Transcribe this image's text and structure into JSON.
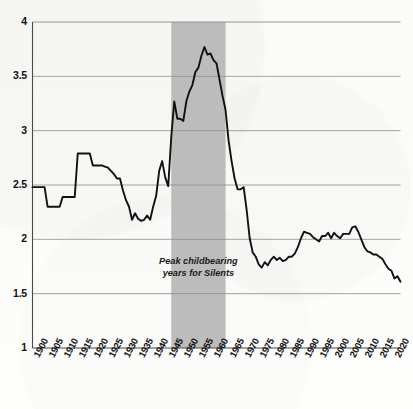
{
  "chart_data": {
    "type": "line",
    "title": "",
    "subtitle": "",
    "xlabel": "",
    "ylabel": "",
    "xlim": [
      1900,
      2022
    ],
    "ylim": [
      1,
      4
    ],
    "grid": true,
    "legend": "none",
    "y_ticks": [
      "4",
      "3.5",
      "3",
      "2.5",
      "2",
      "1.5",
      "1"
    ],
    "y_tick_values": [
      4,
      3.5,
      3,
      2.5,
      2,
      1.5,
      1
    ],
    "x_ticks": [
      "1900",
      "1905",
      "1910",
      "1915",
      "1920",
      "1925",
      "1930",
      "1935",
      "1940",
      "1945",
      "1950",
      "1955",
      "1960",
      "1965",
      "1970",
      "1975",
      "1980",
      "1985",
      "1990",
      "1995",
      "2000",
      "2005",
      "2010",
      "2015",
      "2020"
    ],
    "x_tick_values": [
      1900,
      1905,
      1910,
      1915,
      1920,
      1925,
      1930,
      1935,
      1940,
      1945,
      1950,
      1955,
      1960,
      1965,
      1970,
      1975,
      1980,
      1985,
      1990,
      1995,
      2000,
      2005,
      2010,
      2015,
      2020
    ],
    "line_color": "#111111",
    "shaded_band": {
      "label": "Peak childbearing years for Silents",
      "label_line1": "Peak childbearing",
      "label_line2": "years for Silents",
      "x_start": 1946,
      "x_end": 1964,
      "color": "#bcbcbc"
    },
    "x": [
      1900,
      1901,
      1902,
      1903,
      1904,
      1905,
      1906,
      1907,
      1908,
      1909,
      1910,
      1911,
      1912,
      1913,
      1914,
      1915,
      1916,
      1917,
      1918,
      1919,
      1920,
      1921,
      1922,
      1923,
      1924,
      1925,
      1926,
      1927,
      1928,
      1929,
      1930,
      1931,
      1932,
      1933,
      1934,
      1935,
      1936,
      1937,
      1938,
      1939,
      1940,
      1941,
      1942,
      1943,
      1944,
      1945,
      1946,
      1947,
      1948,
      1949,
      1950,
      1951,
      1952,
      1953,
      1954,
      1955,
      1956,
      1957,
      1958,
      1959,
      1960,
      1961,
      1962,
      1963,
      1964,
      1965,
      1966,
      1967,
      1968,
      1969,
      1970,
      1971,
      1972,
      1973,
      1974,
      1975,
      1976,
      1977,
      1978,
      1979,
      1980,
      1981,
      1982,
      1983,
      1984,
      1985,
      1986,
      1987,
      1988,
      1989,
      1990,
      1991,
      1992,
      1993,
      1994,
      1995,
      1996,
      1997,
      1998,
      1999,
      2000,
      2001,
      2002,
      2003,
      2004,
      2005,
      2006,
      2007,
      2008,
      2009,
      2010,
      2011,
      2012,
      2013,
      2014,
      2015,
      2016,
      2017,
      2018,
      2019,
      2020,
      2021,
      2022
    ],
    "y": [
      2.48,
      2.48,
      2.48,
      2.48,
      2.48,
      2.3,
      2.3,
      2.3,
      2.3,
      2.3,
      2.39,
      2.39,
      2.39,
      2.39,
      2.39,
      2.79,
      2.79,
      2.79,
      2.79,
      2.79,
      2.68,
      2.68,
      2.68,
      2.68,
      2.67,
      2.66,
      2.63,
      2.6,
      2.56,
      2.56,
      2.45,
      2.36,
      2.3,
      2.18,
      2.24,
      2.19,
      2.17,
      2.18,
      2.22,
      2.18,
      2.3,
      2.4,
      2.63,
      2.72,
      2.57,
      2.49,
      2.94,
      3.27,
      3.11,
      3.11,
      3.09,
      3.27,
      3.36,
      3.42,
      3.54,
      3.58,
      3.69,
      3.77,
      3.7,
      3.71,
      3.65,
      3.62,
      3.47,
      3.32,
      3.19,
      2.91,
      2.72,
      2.56,
      2.46,
      2.46,
      2.48,
      2.27,
      2.01,
      1.88,
      1.84,
      1.77,
      1.74,
      1.79,
      1.76,
      1.81,
      1.84,
      1.81,
      1.83,
      1.8,
      1.81,
      1.84,
      1.84,
      1.87,
      1.93,
      2.01,
      2.07,
      2.06,
      2.05,
      2.02,
      2.0,
      1.98,
      2.03,
      2.03,
      2.06,
      2.01,
      2.06,
      2.03,
      2.01,
      2.05,
      2.05,
      2.05,
      2.11,
      2.12,
      2.07,
      2.0,
      1.93,
      1.89,
      1.88,
      1.86,
      1.86,
      1.84,
      1.82,
      1.77,
      1.73,
      1.71,
      1.64,
      1.66,
      1.61
    ]
  }
}
